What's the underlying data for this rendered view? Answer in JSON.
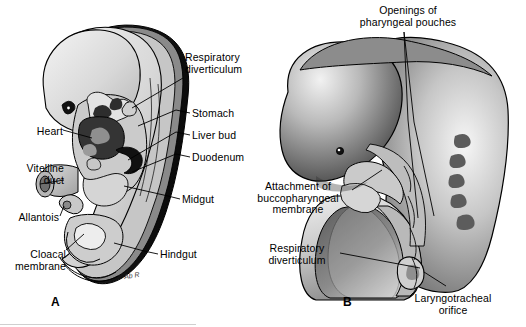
{
  "figure": {
    "type": "anatomical-illustration",
    "panel_count": 2,
    "background_color": "#ffffff",
    "line_color": "#000000"
  },
  "panel_a": {
    "letter": "A",
    "signature": "Ab R",
    "labels": [
      {
        "id": "respiratory-diverticulum",
        "text": "Respiratory\ndiverticulum",
        "align": "left",
        "x": 185,
        "y": 52
      },
      {
        "id": "stomach",
        "text": "Stomach",
        "align": "left",
        "x": 192,
        "y": 108
      },
      {
        "id": "liver-bud",
        "text": "Liver bud",
        "align": "left",
        "x": 192,
        "y": 130
      },
      {
        "id": "duodenum",
        "text": "Duodenum",
        "align": "left",
        "x": 192,
        "y": 152
      },
      {
        "id": "midgut",
        "text": "Midgut",
        "align": "left",
        "x": 182,
        "y": 194
      },
      {
        "id": "hindgut",
        "text": "Hindgut",
        "align": "left",
        "x": 160,
        "y": 249
      },
      {
        "id": "heart",
        "text": "Heart",
        "align": "right",
        "x": 30,
        "y": 126
      },
      {
        "id": "vitelline-duct",
        "text": "Vitelline\nduct",
        "align": "right",
        "x": 17,
        "y": 163
      },
      {
        "id": "allantois",
        "text": "Allantois",
        "align": "right",
        "x": 16,
        "y": 212
      },
      {
        "id": "cloacal-membrane",
        "text": "Cloacal\nmembrane",
        "align": "right",
        "x": 23,
        "y": 249
      }
    ]
  },
  "panel_b": {
    "letter": "B",
    "labels": [
      {
        "id": "openings-of-pharyngeal-pouches",
        "text": "Openings of\npharyngeal pouches",
        "align": "center",
        "x": 408,
        "y": 5
      },
      {
        "id": "attachment-of-buccopharyngeal-membrane",
        "text": "Attachment of\nbuccopharyngeal\nmembrane",
        "align": "center",
        "x": 300,
        "y": 181
      },
      {
        "id": "respiratory-diverticulum-b",
        "text": "Respiratory\ndiverticulum",
        "align": "center",
        "x": 300,
        "y": 243
      },
      {
        "id": "laryngotracheal-orifice",
        "text": "Laryngotracheal\norifice",
        "align": "center",
        "x": 460,
        "y": 293
      }
    ]
  },
  "palette": {
    "ink": "#000000",
    "white": "#ffffff",
    "light_gray": "#d9d9d9",
    "mid_gray": "#a8a8a8",
    "dark_gray": "#5a5a5a",
    "near_black": "#1a1a1a",
    "pale": "#eeeeee"
  }
}
